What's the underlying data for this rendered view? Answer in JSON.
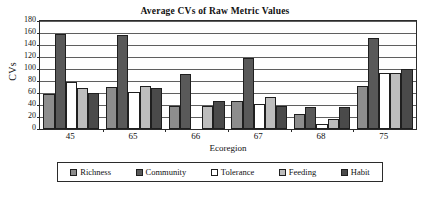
{
  "chart_data": {
    "type": "bar",
    "title": "Average CVs of Raw Metric Values",
    "xlabel": "Ecoregion",
    "ylabel": "CVs",
    "categories": [
      "45",
      "65",
      "66",
      "67",
      "68",
      "75"
    ],
    "ylim": [
      0,
      180
    ],
    "yticks": [
      0,
      20,
      40,
      60,
      80,
      100,
      120,
      140,
      160,
      180
    ],
    "grid": true,
    "legend_position": "bottom",
    "series": [
      {
        "name": "Richness",
        "color": "#8d8d8d",
        "values": [
          59,
          70,
          38,
          46,
          25,
          71
        ]
      },
      {
        "name": "Community",
        "color": "#595959",
        "values": [
          158,
          156,
          91,
          119,
          37,
          151
        ]
      },
      {
        "name": "Tolerance",
        "color": "#ffffff",
        "values": [
          79,
          62,
          0,
          42,
          8,
          93
        ]
      },
      {
        "name": "Feeding",
        "color": "#bdbdbd",
        "values": [
          68,
          71,
          38,
          53,
          17,
          93
        ]
      },
      {
        "name": "Habit",
        "color": "#4a4a4a",
        "values": [
          60,
          69,
          46,
          38,
          36,
          100
        ]
      }
    ]
  },
  "legend": {
    "items": [
      {
        "label": "Richness",
        "color": "#8d8d8d"
      },
      {
        "label": "Community",
        "color": "#595959"
      },
      {
        "label": "Tolerance",
        "color": "#ffffff"
      },
      {
        "label": "Feeding",
        "color": "#bdbdbd"
      },
      {
        "label": "Habit",
        "color": "#4a4a4a"
      }
    ]
  },
  "colors": {
    "axis": "#2b2b2b",
    "gridline": "#5f5f5f",
    "background": "#ffffff",
    "text": "#111111"
  }
}
